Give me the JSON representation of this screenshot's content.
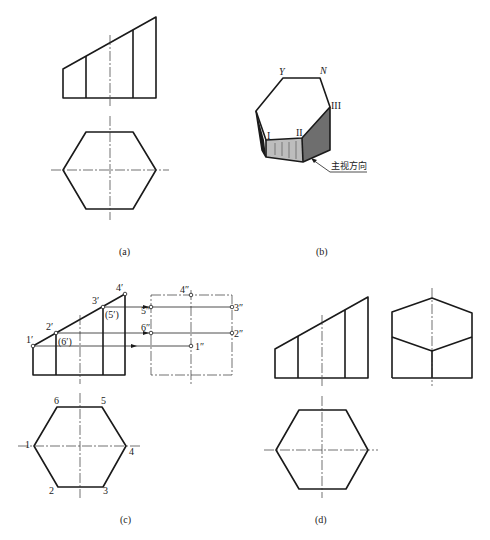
{
  "figure": {
    "panels": [
      {
        "id": "a",
        "caption": "(a)",
        "description": "Front and top views of hexagonal prism truncated by inclined plane"
      },
      {
        "id": "b",
        "caption": "(b)",
        "description": "Pictorial sketch of truncated hexagonal prism"
      },
      {
        "id": "c",
        "caption": "(c)",
        "description": "Construction of side view by projecting points"
      },
      {
        "id": "d",
        "caption": "(d)",
        "description": "Completed three views"
      }
    ],
    "panel_b": {
      "vertex_labels": {
        "Y": "Y",
        "N": "N",
        "I": "I",
        "II": "II",
        "III": "III"
      },
      "view_direction_label": "主视方向"
    },
    "panel_c": {
      "front_labels": {
        "p1": "1′",
        "p2": "2′",
        "p6": "(6′)",
        "p3": "3′",
        "p5": "(5′)",
        "p4": "4′"
      },
      "side_labels": {
        "p4": "4″",
        "p5": "5″",
        "p3": "3″",
        "p6": "6″",
        "p2": "2″",
        "p1": "1″"
      },
      "top_labels": {
        "p1": "1",
        "p2": "2",
        "p3": "3",
        "p4": "4",
        "p5": "5",
        "p6": "6"
      }
    }
  }
}
